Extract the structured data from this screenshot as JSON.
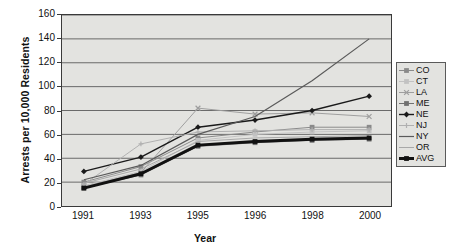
{
  "chart_data": {
    "type": "line",
    "title": "",
    "xlabel": "Year",
    "ylabel": "Arrests per 10,000 Residents",
    "categories": [
      "1991",
      "1993",
      "1995",
      "1996",
      "1998",
      "2000"
    ],
    "xtick_labels": [
      "1991",
      "1993",
      "1995",
      "1996",
      "1998",
      "2000"
    ],
    "ytick_labels": [
      "0",
      "20",
      "40",
      "60",
      "80",
      "100",
      "120",
      "140",
      "160"
    ],
    "ylim": [
      0,
      160
    ],
    "ytick_step": 20,
    "grid": "horizontal",
    "legend_position": "right",
    "series": [
      {
        "name": "CO",
        "values": [
          20,
          33,
          57,
          62,
          66,
          66
        ],
        "color": "#8a8a8a",
        "marker": "square",
        "width": 1
      },
      {
        "name": "CT",
        "values": [
          17,
          29,
          55,
          60,
          62,
          63
        ],
        "color": "#c2c2c2",
        "marker": "square",
        "width": 1
      },
      {
        "name": "LA",
        "values": [
          16,
          28,
          82,
          77,
          78,
          75
        ],
        "color": "#9e9e9e",
        "marker": "cross",
        "width": 1
      },
      {
        "name": "ME",
        "values": [
          15,
          26,
          50,
          53,
          55,
          56
        ],
        "color": "#707070",
        "marker": "square",
        "width": 1
      },
      {
        "name": "NE",
        "values": [
          29,
          41,
          66,
          72,
          80,
          92
        ],
        "color": "#1a1a1a",
        "marker": "diamond",
        "width": 1.4
      },
      {
        "name": "NJ",
        "values": [
          18,
          52,
          62,
          63,
          64,
          64
        ],
        "color": "#b0b0b0",
        "marker": "plus",
        "width": 1
      },
      {
        "name": "NY",
        "values": [
          22,
          34,
          60,
          75,
          105,
          140
        ],
        "color": "#5a5a5a",
        "marker": "none",
        "width": 1.2
      },
      {
        "name": "OR",
        "values": [
          19,
          31,
          54,
          57,
          58,
          59
        ],
        "color": "#a8a8a8",
        "marker": "none",
        "width": 1
      },
      {
        "name": "AVG",
        "values": [
          15,
          27,
          51,
          54,
          56,
          57
        ],
        "color": "#111111",
        "marker": "square",
        "width": 3
      }
    ]
  }
}
